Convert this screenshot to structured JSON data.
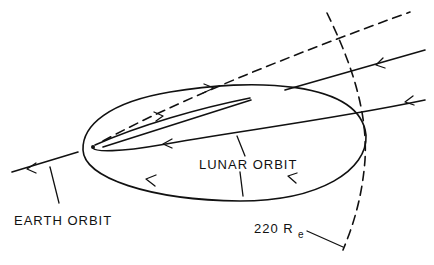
{
  "figure": {
    "type": "orbital trajectory diagram",
    "background": "#ffffff",
    "ink_color": "#111111"
  },
  "labels": {
    "lunar_orbit": "LUNAR ORBIT",
    "earth_orbit": "EARTH ORBIT",
    "radius_value": "220 R",
    "radius_subscript": "e"
  },
  "elements": {
    "earth": "earth-dot",
    "lunar_orbit": "ellipse with counter-clockwise arrows",
    "earth_orbit": "line with leftward arrow",
    "trajectories": [
      "outbound solid lines",
      "inbound solid lines",
      "dashed escape line"
    ],
    "boundary": "dashed arc at 220 Re"
  }
}
